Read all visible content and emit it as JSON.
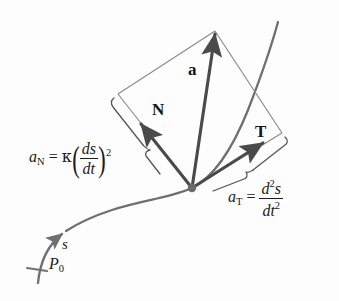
{
  "figure": {
    "background_color": "#fdfdfd",
    "curve_color": "#6f6f6f",
    "vector_color": "#4a4a4a",
    "construction_color": "#8a8a8a",
    "text_color": "#1a1a1a"
  },
  "vectors": {
    "acceleration": {
      "label": "a",
      "name": "acceleration-vector",
      "description": "total acceleration vector"
    },
    "normal": {
      "label": "N",
      "name": "normal-vector",
      "description": "principal unit normal direction component"
    },
    "tangential": {
      "label": "T",
      "name": "tangential-vector",
      "description": "unit tangent direction component"
    }
  },
  "formulas": {
    "normal_component": {
      "lhs_var": "a",
      "lhs_sub": "N",
      "equals": "=",
      "kappa": "κ",
      "paren_open": "(",
      "paren_close": ")",
      "numerator": "ds",
      "denominator": "dt",
      "exponent": "2",
      "plain": "a_N = κ(ds/dt)²"
    },
    "tangential_component": {
      "lhs_var": "a",
      "lhs_sub": "T",
      "equals": "=",
      "numerator_var": "d",
      "numerator_exp": "2",
      "numerator_tail": "s",
      "denominator_var": "dt",
      "denominator_exp": "2",
      "plain": "a_T = d²s/dt²"
    }
  },
  "curve": {
    "arc_length_label": "s",
    "start_point_label": "P",
    "start_point_sub": "0",
    "description": "smooth space curve with direction of increasing arc length"
  }
}
